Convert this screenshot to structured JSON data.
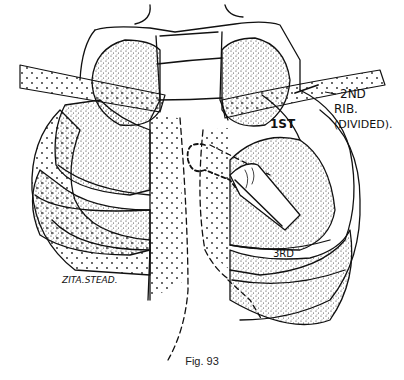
{
  "figure": {
    "caption": "Fig. 93",
    "labels": {
      "rib_2nd_line1": "2ND",
      "rib_2nd_line2": "RIB.",
      "rib_2nd_line3": "(DIVIDED).",
      "rib_1st": "1ST",
      "rib_3rd": "3RD",
      "signature": "ZITA.STEAD."
    },
    "style": {
      "ink": "#111111",
      "paper": "#ffffff"
    }
  }
}
